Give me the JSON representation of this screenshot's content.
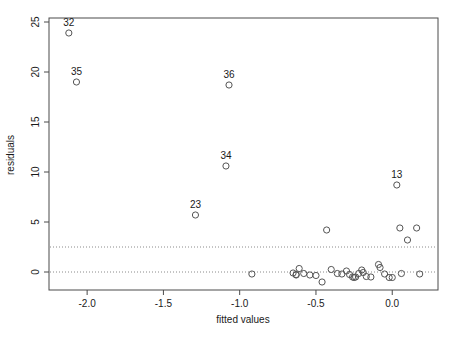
{
  "chart_data": {
    "type": "scatter",
    "title": "",
    "xlabel": "fitted values",
    "ylabel": "residuals",
    "xlim": [
      -2.25,
      0.3
    ],
    "ylim": [
      -1.8,
      25.4
    ],
    "grid": false,
    "legend": null,
    "xticks": [
      -2.0,
      -1.5,
      -1.0,
      -0.5,
      0.0
    ],
    "xticklabels": [
      "-2.0",
      "-1.5",
      "-1.0",
      "-0.5",
      "0.0"
    ],
    "yticks": [
      0,
      5,
      10,
      15,
      20,
      25
    ],
    "yticklabels": [
      "0",
      "5",
      "10",
      "15",
      "20",
      "25"
    ],
    "reference_lines": [
      {
        "y": 0.0,
        "style": "dotted"
      },
      {
        "y": 2.5,
        "style": "dotted"
      }
    ],
    "annotations": [
      {
        "label": "32",
        "x": -2.12,
        "y": 23.9
      },
      {
        "label": "35",
        "x": -2.07,
        "y": 19.0
      },
      {
        "label": "36",
        "x": -1.07,
        "y": 18.7
      },
      {
        "label": "34",
        "x": -1.09,
        "y": 10.6
      },
      {
        "label": "23",
        "x": -1.29,
        "y": 5.7
      },
      {
        "label": "13",
        "x": 0.03,
        "y": 8.7
      }
    ],
    "points": [
      {
        "x": -2.12,
        "y": 23.9
      },
      {
        "x": -2.07,
        "y": 19.0
      },
      {
        "x": -1.07,
        "y": 18.7
      },
      {
        "x": -1.09,
        "y": 10.6
      },
      {
        "x": -1.29,
        "y": 5.7
      },
      {
        "x": 0.03,
        "y": 8.7
      },
      {
        "x": -0.43,
        "y": 4.2
      },
      {
        "x": 0.05,
        "y": 4.4
      },
      {
        "x": 0.16,
        "y": 4.4
      },
      {
        "x": 0.1,
        "y": 3.2
      },
      {
        "x": -0.92,
        "y": -0.2
      },
      {
        "x": -0.65,
        "y": -0.1
      },
      {
        "x": -0.63,
        "y": -0.25
      },
      {
        "x": -0.63,
        "y": -0.3
      },
      {
        "x": -0.61,
        "y": 0.35
      },
      {
        "x": -0.58,
        "y": -0.15
      },
      {
        "x": -0.54,
        "y": -0.3
      },
      {
        "x": -0.5,
        "y": -0.35
      },
      {
        "x": -0.46,
        "y": -1.0
      },
      {
        "x": -0.4,
        "y": 0.25
      },
      {
        "x": -0.36,
        "y": -0.15
      },
      {
        "x": -0.33,
        "y": -0.2
      },
      {
        "x": -0.3,
        "y": 0.1
      },
      {
        "x": -0.28,
        "y": -0.25
      },
      {
        "x": -0.26,
        "y": -0.5
      },
      {
        "x": -0.25,
        "y": -0.55
      },
      {
        "x": -0.24,
        "y": -0.5
      },
      {
        "x": -0.22,
        "y": -0.15
      },
      {
        "x": -0.2,
        "y": 0.2
      },
      {
        "x": -0.19,
        "y": -0.05
      },
      {
        "x": -0.17,
        "y": -0.45
      },
      {
        "x": -0.14,
        "y": -0.5
      },
      {
        "x": -0.09,
        "y": 0.75
      },
      {
        "x": -0.08,
        "y": 0.45
      },
      {
        "x": -0.05,
        "y": -0.2
      },
      {
        "x": -0.02,
        "y": -0.55
      },
      {
        "x": 0.0,
        "y": -0.55
      },
      {
        "x": 0.06,
        "y": -0.15
      },
      {
        "x": 0.18,
        "y": -0.2
      }
    ]
  }
}
